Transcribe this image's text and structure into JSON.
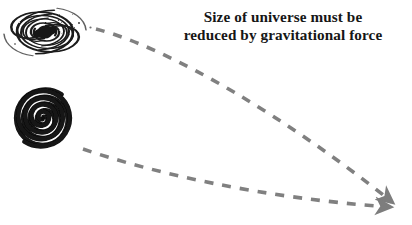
{
  "figure": {
    "background_color": "#ffffff",
    "caption": {
      "line1": "Size of universe must be",
      "line2": "reduced by gravitational force",
      "color": "#161616",
      "weight": "bold"
    },
    "arrow_color": "#808080",
    "galaxy_color": "#1a1a1a",
    "objects": [
      {
        "name": "large-open-spiral-galaxy",
        "description": "wide multi-arm spiral galaxy, loosely wound, dark core",
        "x": 12,
        "y": 10,
        "width": 66,
        "height": 44
      },
      {
        "name": "small-dense-spiral-galaxy",
        "description": "tightly wound thick dark spiral, compact",
        "x": 13,
        "y": 87,
        "width": 60,
        "height": 62
      }
    ],
    "arrows": [
      {
        "name": "upper-contraction-arrow",
        "from_label": "large-open-spiral-galaxy",
        "to_x": 396,
        "to_y": 205,
        "from_x": 93,
        "from_y": 28,
        "style": "dashed",
        "color": "#808080"
      },
      {
        "name": "lower-contraction-arrow",
        "from_label": "small-dense-spiral-galaxy",
        "to_x": 397,
        "to_y": 208,
        "from_x": 82,
        "from_y": 148,
        "style": "dashed",
        "color": "#808080"
      }
    ]
  }
}
